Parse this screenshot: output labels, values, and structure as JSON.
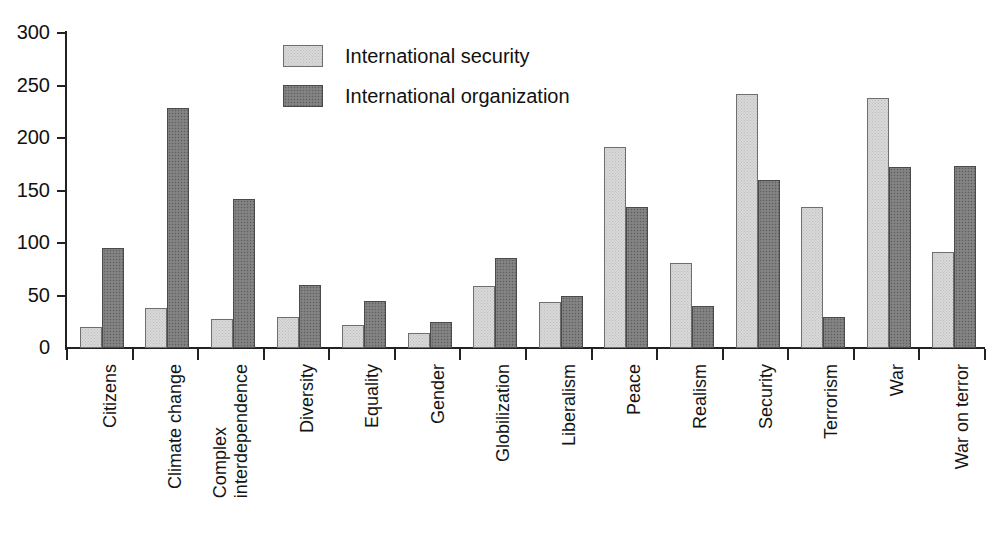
{
  "chart_data": {
    "type": "bar",
    "title": "",
    "xlabel": "",
    "ylabel": "",
    "ylim": [
      0,
      300
    ],
    "yticks": [
      0,
      50,
      100,
      150,
      200,
      250,
      300
    ],
    "ytick_labels": [
      "0",
      "50",
      "100",
      "150",
      "200",
      "250",
      "300"
    ],
    "grid": false,
    "legend_position": "upper-center",
    "categories": [
      "Citizens",
      "Climate change",
      "Complex interdependence",
      "Diversity",
      "Equality",
      "Gender",
      "Globilization",
      "Liberalism",
      "Peace",
      "Realism",
      "Security",
      "Terrorism",
      "War",
      "War on terror"
    ],
    "category_lines": [
      [
        "Citizens"
      ],
      [
        "Climate change"
      ],
      [
        "Complex",
        "interdependence"
      ],
      [
        "Diversity"
      ],
      [
        "Equality"
      ],
      [
        "Gender"
      ],
      [
        "Globilization"
      ],
      [
        "Liberalism"
      ],
      [
        "Peace"
      ],
      [
        "Realism"
      ],
      [
        "Security"
      ],
      [
        "Terrorism"
      ],
      [
        "War"
      ],
      [
        "War on terror"
      ]
    ],
    "series": [
      {
        "name": "International security",
        "color": "#d9d9d9",
        "values": [
          20,
          38,
          28,
          30,
          22,
          14,
          59,
          44,
          191,
          81,
          242,
          134,
          238,
          91
        ]
      },
      {
        "name": "International organization",
        "color": "#7d7d7d",
        "values": [
          95,
          229,
          142,
          60,
          45,
          25,
          86,
          50,
          134,
          40,
          160,
          30,
          172,
          173
        ]
      }
    ]
  },
  "legend": {
    "entries": [
      {
        "label": "International security",
        "swatch": "light-gray-swatch"
      },
      {
        "label": "International organization",
        "swatch": "dark-gray-swatch"
      }
    ]
  },
  "colors": {
    "series_light": "#d9d9d9",
    "series_dark": "#7d7d7d",
    "axis": "#222222",
    "background": "#ffffff",
    "text": "#111111"
  }
}
